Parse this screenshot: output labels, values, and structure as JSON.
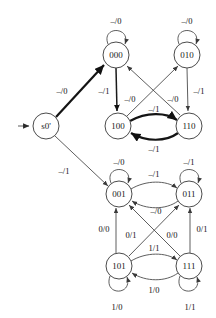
{
  "diagram": {
    "background_color": "#ffffff",
    "node_stroke_color": "#4c4c4c",
    "edge_color": "#4c4c4c",
    "emphasis_edge_color": "#141414",
    "label_color": "#111111"
  },
  "nodes": [
    {
      "id": "s0",
      "label": "s0'",
      "cx": 46,
      "cy": 126,
      "r": 13
    },
    {
      "id": "n000",
      "label": "000",
      "cx": 116,
      "cy": 55,
      "r": 13
    },
    {
      "id": "n010",
      "label": "010",
      "cx": 187,
      "cy": 55,
      "r": 13
    },
    {
      "id": "n100",
      "label": "100",
      "cx": 118,
      "cy": 126,
      "r": 13
    },
    {
      "id": "n110",
      "label": "110",
      "cx": 189,
      "cy": 126,
      "r": 13
    },
    {
      "id": "n001",
      "label": "001",
      "cx": 119,
      "cy": 194,
      "r": 13
    },
    {
      "id": "n011",
      "label": "011",
      "cx": 189,
      "cy": 194,
      "r": 13
    },
    {
      "id": "n101",
      "label": "101",
      "cx": 119,
      "cy": 266,
      "r": 13
    },
    {
      "id": "n111",
      "label": "111",
      "cx": 189,
      "cy": 266,
      "r": 13
    }
  ],
  "start_arrow": {
    "name": "start-arrow",
    "from_x": 18,
    "to_x": 31,
    "y": 126
  },
  "edges": [
    {
      "id": "e-s0-000",
      "from": "s0",
      "to": "n000",
      "label": "–/0",
      "lx": 62,
      "ly": 92,
      "weight": "thick"
    },
    {
      "id": "e-s0-001",
      "from": "s0",
      "to": "n001",
      "label": "–/1",
      "lx": 64,
      "ly": 172,
      "weight": "thin"
    },
    {
      "id": "e-000-self",
      "from": "n000",
      "to": "n000",
      "label": "–/0",
      "lx": 116,
      "ly": 22,
      "weight": "thin"
    },
    {
      "id": "e-010-self",
      "from": "n010",
      "to": "n010",
      "label": "–/0",
      "lx": 187,
      "ly": 22,
      "weight": "thin"
    },
    {
      "id": "e-001-self",
      "from": "n001",
      "to": "n001",
      "label": "–/0",
      "lx": 119,
      "ly": 163,
      "weight": "thin"
    },
    {
      "id": "e-011-self",
      "from": "n011",
      "to": "n011",
      "label": "–/1",
      "lx": 189,
      "ly": 163,
      "weight": "thin"
    },
    {
      "id": "e-101-self",
      "from": "n101",
      "to": "n101",
      "label": "1/0",
      "lx": 117,
      "ly": 308,
      "weight": "thin"
    },
    {
      "id": "e-111-self",
      "from": "n111",
      "to": "n111",
      "label": "1/1",
      "lx": 190,
      "ly": 308,
      "weight": "thin"
    },
    {
      "id": "e-000-100",
      "from": "n000",
      "to": "n100",
      "label": "–/1",
      "lx": 104,
      "ly": 92,
      "weight": "med"
    },
    {
      "id": "e-010-110",
      "from": "n010",
      "to": "n110",
      "label": "–/1",
      "lx": 199,
      "ly": 92,
      "weight": "thin"
    },
    {
      "id": "e-110-000",
      "from": "n110",
      "to": "n000",
      "label": "–/0",
      "lx": 130,
      "ly": 100,
      "weight": "thin"
    },
    {
      "id": "e-100-010",
      "from": "n100",
      "to": "n010",
      "label": "–/0",
      "lx": 173,
      "ly": 100,
      "weight": "thin"
    },
    {
      "id": "e-100-110",
      "from": "n100",
      "to": "n110",
      "label": "–/1",
      "lx": 154,
      "ly": 110,
      "weight": "thick"
    },
    {
      "id": "e-110-100",
      "from": "n110",
      "to": "n100",
      "label": "–/1",
      "lx": 154,
      "ly": 150,
      "weight": "thick"
    },
    {
      "id": "e-001-011",
      "from": "n001",
      "to": "n011",
      "label": "–/1",
      "lx": 154,
      "ly": 175,
      "weight": "thin"
    },
    {
      "id": "e-011-001",
      "from": "n011",
      "to": "n001",
      "label": "–/0",
      "lx": 156,
      "ly": 212,
      "weight": "thin"
    },
    {
      "id": "e-101-001",
      "from": "n101",
      "to": "n001",
      "label": "0/0",
      "lx": 104,
      "ly": 230,
      "weight": "thin"
    },
    {
      "id": "e-111-011",
      "from": "n111",
      "to": "n011",
      "label": "0/1",
      "lx": 202,
      "ly": 230,
      "weight": "thin"
    },
    {
      "id": "e-111-001",
      "from": "n111",
      "to": "n001",
      "label": "0/1",
      "lx": 131,
      "ly": 236,
      "weight": "thin"
    },
    {
      "id": "e-101-011",
      "from": "n101",
      "to": "n011",
      "label": "0/0",
      "lx": 172,
      "ly": 236,
      "weight": "thin"
    },
    {
      "id": "e-101-111",
      "from": "n101",
      "to": "n111",
      "label": "1/1",
      "lx": 154,
      "ly": 249,
      "weight": "thin"
    },
    {
      "id": "e-111-101",
      "from": "n111",
      "to": "n101",
      "label": "1/0",
      "lx": 154,
      "ly": 291,
      "weight": "thin"
    }
  ]
}
